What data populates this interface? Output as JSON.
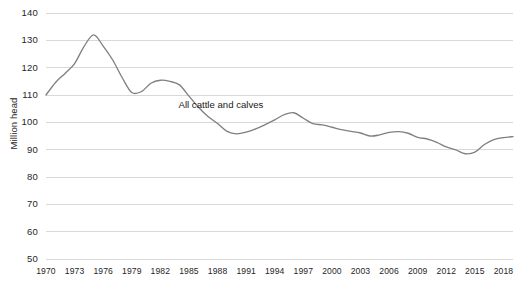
{
  "chart_data": {
    "type": "line",
    "title": "",
    "subtitle": "",
    "xlabel": "",
    "ylabel": "Million head",
    "xlim": [
      1970,
      2019
    ],
    "ylim": [
      50,
      140
    ],
    "ytick_step": 10,
    "xtick_step": 3,
    "grid": "horizontal",
    "legend": "inline-annotation",
    "annotations": [
      {
        "text": "All cattle and calves",
        "x": 1988,
        "y": 106.5
      }
    ],
    "yticks": [
      140,
      130,
      120,
      110,
      100,
      90,
      80,
      70,
      60,
      50
    ],
    "xticks": [
      1970,
      1973,
      1976,
      1979,
      1982,
      1985,
      1988,
      1991,
      1994,
      1997,
      2000,
      2003,
      2006,
      2009,
      2012,
      2015,
      2018
    ],
    "series": [
      {
        "name": "All cattle and calves",
        "color": "#808080",
        "x": [
          1970,
          1971,
          1972,
          1973,
          1974,
          1975,
          1976,
          1977,
          1978,
          1979,
          1980,
          1981,
          1982,
          1983,
          1984,
          1985,
          1986,
          1987,
          1988,
          1989,
          1990,
          1991,
          1992,
          1993,
          1994,
          1995,
          1996,
          1997,
          1998,
          1999,
          2000,
          2001,
          2002,
          2003,
          2004,
          2005,
          2006,
          2007,
          2008,
          2009,
          2010,
          2011,
          2012,
          2013,
          2014,
          2015,
          2016,
          2017,
          2018,
          2019
        ],
        "values": [
          110.0,
          114.6,
          117.9,
          121.5,
          127.8,
          132.0,
          127.9,
          122.8,
          116.3,
          110.9,
          111.2,
          114.3,
          115.4,
          115.0,
          113.7,
          109.6,
          105.5,
          102.1,
          99.6,
          96.7,
          95.8,
          96.4,
          97.6,
          99.2,
          100.9,
          102.8,
          103.5,
          101.5,
          99.5,
          99.1,
          98.2,
          97.3,
          96.7,
          96.1,
          95.0,
          95.4,
          96.3,
          96.6,
          96.0,
          94.5,
          93.9,
          92.7,
          91.0,
          89.9,
          88.5,
          89.1,
          91.9,
          93.7,
          94.4,
          94.8
        ]
      }
    ],
    "units": "million head"
  },
  "axes": {
    "y_axis_title": "Million head",
    "y_tick_labels": [
      "140",
      "130",
      "120",
      "110",
      "100",
      "90",
      "80",
      "70",
      "60",
      "50"
    ],
    "x_tick_labels": [
      "1970",
      "1973",
      "1976",
      "1979",
      "1982",
      "1985",
      "1988",
      "1991",
      "1994",
      "1997",
      "2000",
      "2003",
      "2006",
      "2009",
      "2012",
      "2015",
      "2018"
    ]
  },
  "annotation": {
    "series_label": "All cattle and calves"
  },
  "colors": {
    "line": "#808080",
    "gridline": "#d9d9d9",
    "text": "#262626",
    "background": "#ffffff"
  }
}
